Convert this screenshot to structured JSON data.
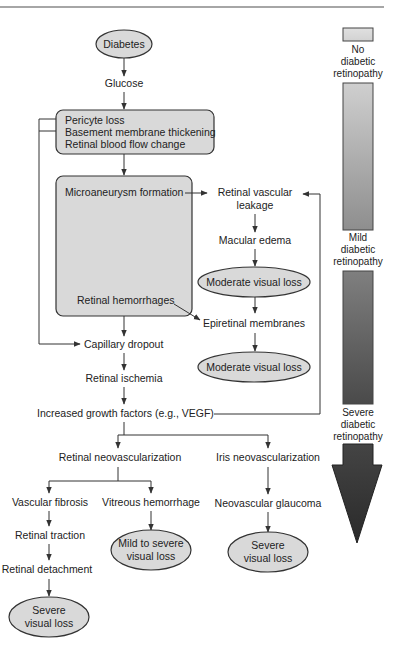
{
  "diagram": {
    "type": "flowchart",
    "nodes": {
      "diabetes": "Diabetes",
      "glucose": "Glucose",
      "early_box": [
        "Pericyte loss",
        "Basement membrane thickening",
        "Retinal blood flow change"
      ],
      "microaneurysm": "Microaneurysm formation",
      "hemorrhages": "Retinal hemorrhages",
      "vascular_leakage": [
        "Retinal vascular",
        "leakage"
      ],
      "macular_edema": "Macular edema",
      "moderate_loss_1": "Moderate visual loss",
      "epiretinal": "Epiretinal membranes",
      "moderate_loss_2": "Moderate visual loss",
      "capillary_dropout": "Capillary dropout",
      "ischemia": "Retinal ischemia",
      "growth_factors": "Increased growth factors (e.g., VEGF)",
      "retinal_neo": "Retinal neovascularization",
      "iris_neo": "Iris neovascularization",
      "fibrosis": "Vascular fibrosis",
      "vitreous_hem": "Vitreous hemorrhage",
      "glaucoma": "Neovascular glaucoma",
      "traction": "Retinal traction",
      "mild_severe_loss": [
        "Mild to severe",
        "visual loss"
      ],
      "severe_loss_iris": [
        "Severe",
        "visual loss"
      ],
      "detachment": "Retinal detachment",
      "severe_loss_detach": [
        "Severe",
        "visual loss"
      ]
    },
    "severity_scale": {
      "stages": [
        [
          "No",
          "diabetic",
          "retinopathy"
        ],
        [
          "Mild",
          "diabetic",
          "retinopathy"
        ],
        [
          "Severe",
          "diabetic",
          "retinopathy"
        ]
      ],
      "colors": {
        "light": "#d4d4d4",
        "mid": "#9a9a9a",
        "dark": "#3a3a3a"
      }
    },
    "colors": {
      "node_fill": "#d9d9d9",
      "stroke": "#333333",
      "text": "#222222"
    }
  }
}
